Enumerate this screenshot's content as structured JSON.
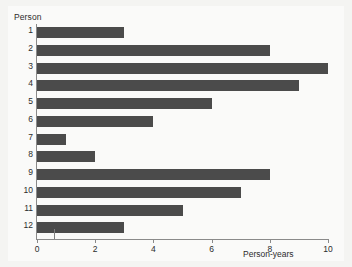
{
  "chart_data": {
    "type": "bar",
    "orientation": "horizontal",
    "title": "",
    "xlabel": "Person-years",
    "ylabel": "Person",
    "categories": [
      "1",
      "2",
      "3",
      "4",
      "5",
      "6",
      "7",
      "8",
      "9",
      "10",
      "11",
      "12"
    ],
    "values": [
      3,
      8,
      10,
      9,
      6,
      4,
      1,
      2,
      8,
      7,
      5,
      3
    ],
    "xlim": [
      0,
      10
    ],
    "xticks": [
      0,
      2,
      4,
      6,
      8,
      10
    ],
    "xtick_labels": [
      "0",
      "2",
      "4",
      "6",
      "8",
      "10"
    ],
    "grid": false,
    "legend": null,
    "bar_color": "#4b4b4b",
    "background_color": "#fafaf9",
    "axis_color": "#8a8a8a"
  },
  "annotations": {
    "stray_tick_value": 0.6
  }
}
